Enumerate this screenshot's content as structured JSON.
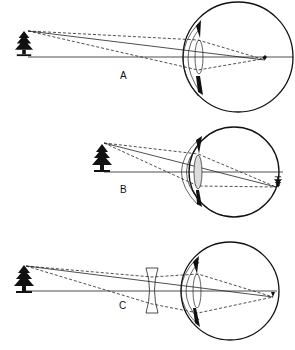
{
  "figure": {
    "panels": [
      {
        "id": "A",
        "label": "A",
        "description": "Distant object; rays focus in front of retina (myopia)"
      },
      {
        "id": "B",
        "label": "B",
        "description": "Nearer object; image focused on retina"
      },
      {
        "id": "C",
        "label": "C",
        "description": "Distant object with diverging (concave) corrective lens; image on retina"
      }
    ],
    "colors": {
      "ink": "#111111",
      "background": "#ffffff"
    }
  }
}
